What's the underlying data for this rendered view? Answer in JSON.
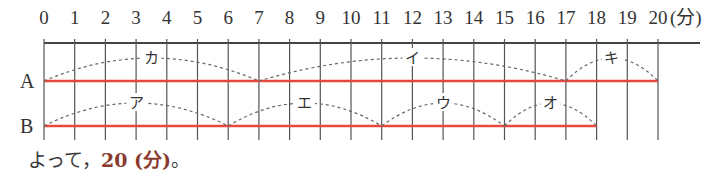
{
  "chart_data": {
    "type": "timeline",
    "axis": {
      "min": 0,
      "max": 20,
      "step": 1,
      "unit_label": "(分)",
      "tick_labels": [
        "0",
        "1",
        "2",
        "3",
        "4",
        "5",
        "6",
        "7",
        "8",
        "9",
        "10",
        "11",
        "12",
        "13",
        "14",
        "15",
        "16",
        "17",
        "18",
        "19",
        "20"
      ]
    },
    "rows": [
      {
        "name": "A",
        "bar": {
          "start": 0,
          "end": 20
        },
        "segments": [
          {
            "label": "カ",
            "start": 0,
            "end": 7
          },
          {
            "label": "イ",
            "start": 7,
            "end": 17
          },
          {
            "label": "キ",
            "start": 17,
            "end": 20
          }
        ]
      },
      {
        "name": "B",
        "bar": {
          "start": 0,
          "end": 18
        },
        "segments": [
          {
            "label": "ア",
            "start": 0,
            "end": 6
          },
          {
            "label": "エ",
            "start": 6,
            "end": 11
          },
          {
            "label": "ウ",
            "start": 11,
            "end": 15
          },
          {
            "label": "オ",
            "start": 15,
            "end": 18
          }
        ]
      }
    ],
    "colors": {
      "bar": "#e8473c",
      "grid": "#555555",
      "arc": "#666666",
      "answer": "#8b3a2e"
    }
  },
  "conclusion": {
    "prefix": "よって，",
    "answer": "20 (分)",
    "suffix": "。"
  }
}
